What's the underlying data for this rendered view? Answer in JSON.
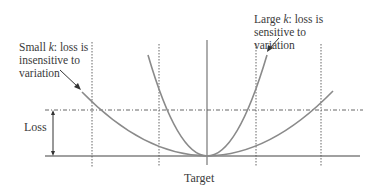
{
  "diagram": {
    "annotations": {
      "small_k": {
        "prefix": "Small ",
        "k": "k",
        "line1_rest": ": loss is",
        "line2": "insensitive to",
        "line3": "variation"
      },
      "large_k": {
        "prefix": "Large ",
        "k": "k",
        "line1_rest": ": loss is",
        "line2": "sensitive to",
        "line3": "variation"
      }
    },
    "axis_labels": {
      "loss": "Loss",
      "target": "Target"
    },
    "curves": [
      {
        "name": "small-k-parabola",
        "description": "wide parabola, small k",
        "color": "#8a8a8a"
      },
      {
        "name": "large-k-parabola",
        "description": "narrow parabola, large k",
        "color": "#8a8a8a"
      }
    ],
    "colors": {
      "curve": "#8a8a8a",
      "axis": "#777777",
      "guide": "#555555",
      "text": "#3a3a3a"
    }
  }
}
